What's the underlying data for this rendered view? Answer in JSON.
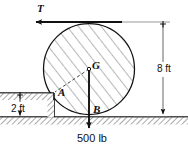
{
  "figure": {
    "type": "free-body-diagram",
    "width": 188,
    "height": 153,
    "background_color": "#ffffff",
    "line_color": "#111111",
    "hatch_color": "#9a9a9a"
  },
  "labels": {
    "tension": "T",
    "center": "G",
    "corner_contact": "A",
    "ground_contact": "B",
    "height_dim": "8 ft",
    "step_dim": "2 ft",
    "load": "500 lb"
  },
  "geometry": {
    "cylinder": {
      "center_x": 89,
      "center_y": 69,
      "radius": 46,
      "diameter_ft": 8,
      "hatched": true
    },
    "points": {
      "G": {
        "x": 89,
        "y": 69,
        "name": "center-of-gravity"
      },
      "A": {
        "x": 54,
        "y": 92,
        "name": "step-corner-contact"
      },
      "B": {
        "x": 89,
        "y": 116,
        "name": "ground-contact"
      }
    },
    "ground_line_y": 117,
    "step_top_y": 93,
    "step_left_x": 0,
    "step_right_x": 54
  },
  "forces": [
    {
      "name": "tension",
      "label": "T",
      "magnitude": null,
      "unit": null,
      "direction": "left",
      "applied_at": "top-of-cylinder",
      "arrow_from": {
        "x": 122,
        "y": 22
      },
      "arrow_to": {
        "x": 33,
        "y": 22
      }
    },
    {
      "name": "weight",
      "label": "500 lb",
      "magnitude": 500,
      "unit": "lb",
      "direction": "down",
      "applied_at": "G",
      "arrow_from": {
        "x": 89,
        "y": 69
      },
      "arrow_to": {
        "x": 89,
        "y": 131
      }
    }
  ],
  "dimensions": [
    {
      "name": "cylinder-height",
      "label": "8 ft",
      "value": 8,
      "unit": "ft",
      "orientation": "vertical",
      "x": 163,
      "y_top": 22,
      "y_bottom": 117
    },
    {
      "name": "step-height",
      "label": "2 ft",
      "value": 2,
      "unit": "ft",
      "orientation": "vertical",
      "x": 20,
      "y_top": 93,
      "y_bottom": 117
    }
  ]
}
